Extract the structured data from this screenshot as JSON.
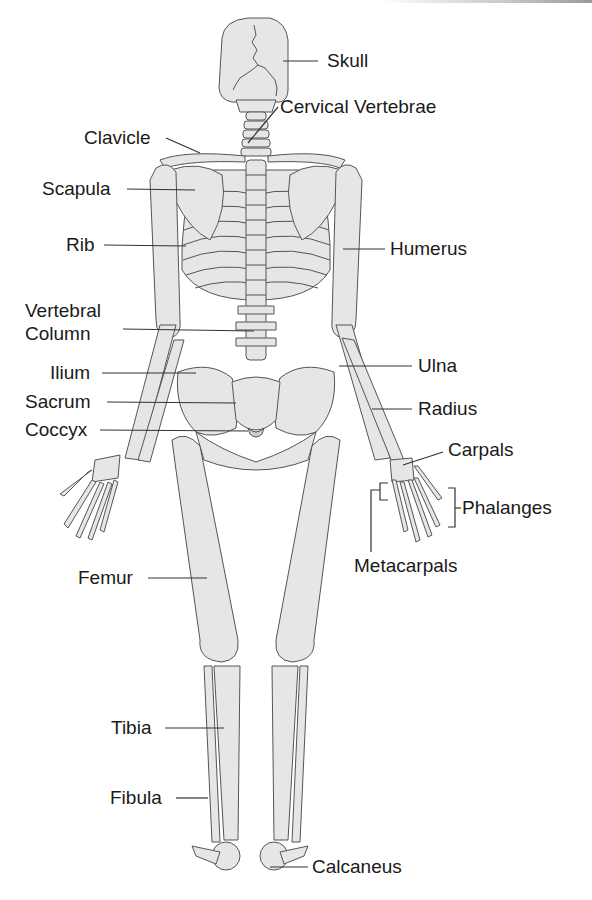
{
  "diagram": {
    "colors": {
      "bone_fill": "#e6e6e6",
      "bone_shade": "#cfcfcf",
      "outline": "#555555",
      "label_text": "#1a1a1a",
      "background": "#ffffff"
    },
    "labels": {
      "skull": "Skull",
      "cervical_vertebrae": "Cervical Vertebrae",
      "clavicle": "Clavicle",
      "scapula": "Scapula",
      "rib": "Rib",
      "humerus": "Humerus",
      "vertebral_column_line1": "Vertebral",
      "vertebral_column_line2": "Column",
      "ilium": "Ilium",
      "ulna": "Ulna",
      "sacrum": "Sacrum",
      "radius": "Radius",
      "coccyx": "Coccyx",
      "carpals": "Carpals",
      "phalanges": "Phalanges",
      "metacarpals": "Metacarpals",
      "femur": "Femur",
      "tibia": "Tibia",
      "fibula": "Fibula",
      "calcaneus": "Calcaneus"
    }
  }
}
